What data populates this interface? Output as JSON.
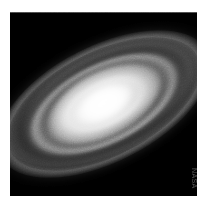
{
  "page": {
    "background_color": "#ffffff",
    "width": 217,
    "height": 206
  },
  "plate": {
    "name": "astronomical-image-plate",
    "background_color": "#000000",
    "x": 10,
    "y": 12,
    "width": 187,
    "height": 184
  },
  "subject": {
    "type": "spiral-galaxy",
    "description": "Inclined spiral galaxy with concentric ring-like spiral arms and a bright elongated central bulge",
    "position_angle_degrees": -27,
    "inclination_axis_ratio": 0.5,
    "core_color": "#ffffff",
    "arm_color": "#e8e8e8",
    "dust_lane_color": "#000000"
  },
  "credit": {
    "label": "NASA",
    "color": "#5a5a5a",
    "rotation_degrees": 90
  }
}
